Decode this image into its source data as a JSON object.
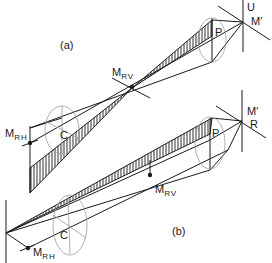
{
  "figure": {
    "panels": [
      {
        "id": "a",
        "caption": "(a)",
        "labels": {
          "U": "U",
          "M_prime": "M′",
          "P": "P",
          "M_RV_main": "M",
          "M_RV_sub": "RV",
          "M_RH_main": "M",
          "M_RH_sub": "RH",
          "C": "C"
        }
      },
      {
        "id": "b",
        "caption": "(b)",
        "labels": {
          "R": "R",
          "M_prime": "M′",
          "P": "P",
          "M_RV_main": "M",
          "M_RV_sub": "RV",
          "M_RH_main": "M",
          "M_RH_sub": "RH",
          "C": "C"
        }
      }
    ],
    "colors": {
      "line": "#1a1a1a",
      "ellipse": "#9a9a9a",
      "background": "#ffffff"
    }
  }
}
